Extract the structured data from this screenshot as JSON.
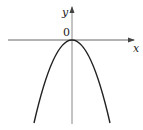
{
  "diagram": {
    "type": "function-graph",
    "function": "y = -a x^2",
    "axes": {
      "x_label": "x",
      "y_label": "y",
      "origin_label": "0"
    },
    "vertex": [
      0,
      0
    ],
    "colors": {
      "axis": "#555555",
      "curve": "#222222",
      "text": "#222222"
    }
  }
}
